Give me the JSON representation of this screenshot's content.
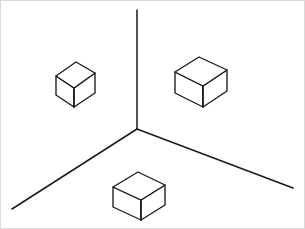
{
  "figure": {
    "caption": "Line drawing: three straight lines meet at a central junction, dividing the plane into three sectors; one identical isometric cube sits in each sector.",
    "canvas": {
      "width": 305,
      "height": 229,
      "background_color": "#ffffff",
      "border_color": "#d9d9d9",
      "line_color": "#1a1a1a",
      "line_width": 1.5
    },
    "vertex": {
      "label": "junction",
      "x": 137,
      "y": 129
    },
    "axes": [
      {
        "name": "upper-axis-line",
        "from": [
          137,
          129
        ],
        "to": [
          137,
          10
        ],
        "direction": "up"
      },
      {
        "name": "lower-left-axis-line",
        "from": [
          137,
          129
        ],
        "to": [
          12,
          209
        ],
        "direction": "down-left"
      },
      {
        "name": "lower-right-axis-line",
        "from": [
          137,
          129
        ],
        "to": [
          293,
          188
        ],
        "direction": "down-right"
      }
    ],
    "cubes": [
      {
        "name": "left-cube",
        "sector": "left",
        "bounds": [
          55,
          62,
          95,
          107
        ],
        "top_face": [
          [
            56,
            76
          ],
          [
            76,
            62
          ],
          [
            95,
            73
          ],
          [
            74,
            88
          ]
        ],
        "left_face": [
          [
            56,
            76
          ],
          [
            74,
            88
          ],
          [
            74,
            107
          ],
          [
            56,
            95
          ]
        ],
        "right_face": [
          [
            74,
            88
          ],
          [
            95,
            73
          ],
          [
            95,
            93
          ],
          [
            74,
            107
          ]
        ]
      },
      {
        "name": "right-cube",
        "sector": "right",
        "bounds": [
          174,
          57,
          227,
          107
        ],
        "top_face": [
          [
            175,
            72
          ],
          [
            199,
            57
          ],
          [
            227,
            70
          ],
          [
            203,
            86
          ]
        ],
        "left_face": [
          [
            175,
            72
          ],
          [
            203,
            86
          ],
          [
            203,
            107
          ],
          [
            175,
            93
          ]
        ],
        "right_face": [
          [
            203,
            86
          ],
          [
            227,
            70
          ],
          [
            227,
            91
          ],
          [
            203,
            107
          ]
        ]
      },
      {
        "name": "bottom-cube",
        "sector": "bottom",
        "bounds": [
          113,
          172,
          165,
          220
        ],
        "top_face": [
          [
            113,
            187
          ],
          [
            138,
            172
          ],
          [
            165,
            185
          ],
          [
            141,
            200
          ]
        ],
        "left_face": [
          [
            113,
            187
          ],
          [
            141,
            200
          ],
          [
            141,
            220
          ],
          [
            113,
            207
          ]
        ],
        "right_face": [
          [
            141,
            200
          ],
          [
            165,
            185
          ],
          [
            165,
            205
          ],
          [
            141,
            220
          ]
        ]
      }
    ]
  }
}
